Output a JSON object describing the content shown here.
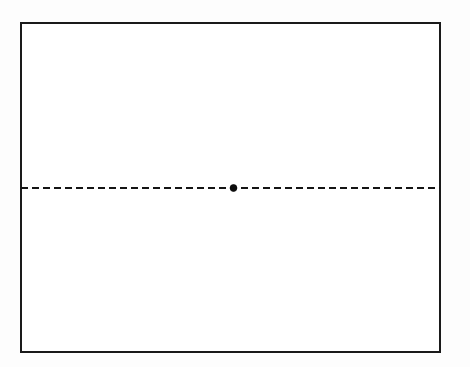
{
  "figure": {
    "title": "",
    "caption": "",
    "background_color": "#fdfdfd",
    "width": 470,
    "height": 367
  },
  "frame": {
    "name": "rectangular-plot-frame",
    "x": 21,
    "y": 23,
    "width": 419,
    "height": 329,
    "stroke_color": "#1a1a1a",
    "stroke_width": 1.6,
    "fill_color": "#ffffff"
  },
  "chart_data": {
    "type": "line",
    "title": "",
    "subtitle": "",
    "xlabel": "",
    "ylabel": "",
    "grid": false,
    "legend": null,
    "legend_position": "none",
    "xlim": [
      21,
      440
    ],
    "ylim": [
      23,
      352
    ],
    "axis_ticks": {
      "x": [],
      "y": []
    },
    "tick_labels": {
      "x": [],
      "y": []
    },
    "annotations": [],
    "series": [
      {
        "name": "horizontal-dashed-axis",
        "style": "dashed",
        "color": "#141414",
        "line_width": 1.8,
        "dash_length": 7,
        "gap_length": 4,
        "x": [
          21,
          440
        ],
        "y": [
          188,
          188
        ]
      }
    ],
    "markers": [
      {
        "name": "center-point",
        "shape": "circle",
        "filled": true,
        "color": "#0d0d0d",
        "x": 233.5,
        "y": 188,
        "radius": 3.4,
        "label": ""
      }
    ]
  },
  "labels": {
    "items": []
  }
}
